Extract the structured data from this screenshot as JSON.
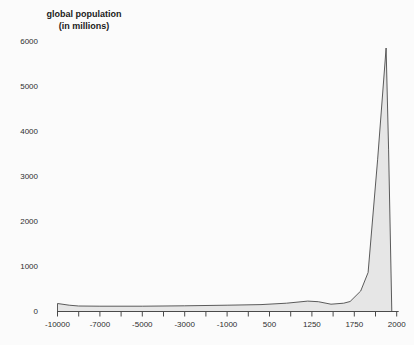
{
  "header": {
    "title_line1": "global population",
    "title_line2": "(in millions)"
  },
  "colors": {
    "background": "#fbfbfb",
    "area_fill": "#e6e6e6",
    "curve_line": "#4a4a4a",
    "axis": "#4a4a4a",
    "text": "#2e2e2e"
  },
  "chart_data": {
    "type": "area",
    "title": "global population",
    "subtitle": "(in millions)",
    "xlabel": "",
    "ylabel": "",
    "grid": false,
    "legend": "none",
    "x_tick_labels": [
      "-10000",
      "-7000",
      "-5000",
      "-3000",
      "-1000",
      "500",
      "1250",
      "1750",
      "2000"
    ],
    "x_tick_count": 17,
    "labels_on_every_other_tick": true,
    "y_ticks": [
      0,
      1000,
      2000,
      3000,
      4000,
      5000,
      6000
    ],
    "ylim": [
      0,
      6300
    ],
    "readings_by_year": {
      "-10000": 180,
      "-7000": 115,
      "-5000": 115,
      "-3000": 125,
      "-1000": 140,
      "500": 185,
      "1250": 230,
      "1500": 165,
      "1750": 220,
      "2000": 5900
    },
    "trace_tickunits_millions": [
      [
        0,
        178
      ],
      [
        0.55,
        140
      ],
      [
        1,
        122
      ],
      [
        2,
        117
      ],
      [
        4,
        117
      ],
      [
        6,
        127
      ],
      [
        8,
        140
      ],
      [
        9.6,
        153
      ],
      [
        10.8,
        184
      ],
      [
        11.8,
        232
      ],
      [
        12.3,
        218
      ],
      [
        12.9,
        163
      ],
      [
        13.5,
        184
      ],
      [
        13.8,
        222
      ],
      [
        14.3,
        456
      ],
      [
        14.65,
        867
      ],
      [
        15.1,
        3370
      ],
      [
        15.5,
        5856
      ],
      [
        15.62,
        3590
      ],
      [
        15.77,
        0
      ]
    ]
  }
}
